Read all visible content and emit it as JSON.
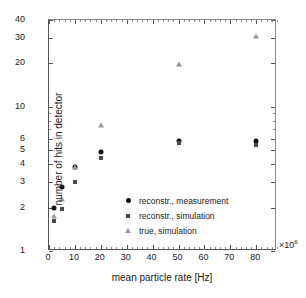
{
  "chart_data": {
    "type": "scatter",
    "title": "",
    "xlabel": "mean particle rate [Hz]",
    "ylabel": "number of hits in detector",
    "x_multiplier": "×10",
    "x_multiplier_exp": "6",
    "xlim": [
      0,
      88
    ],
    "ylim": [
      1,
      40
    ],
    "yscale": "log",
    "xscale": "linear",
    "grid": false,
    "legend_position": "center",
    "xticks": [
      0,
      10,
      20,
      30,
      40,
      50,
      60,
      70,
      80
    ],
    "xtick_labels": [
      "0",
      "10",
      "20",
      "30",
      "40",
      "50",
      "60",
      "70",
      "80"
    ],
    "yticks": [
      1,
      2,
      3,
      4,
      5,
      6,
      10,
      20,
      30,
      40
    ],
    "ytick_labels": [
      "1",
      "2",
      "3",
      "4",
      "5",
      "6",
      "10",
      "20",
      "30",
      "40"
    ],
    "yminor": [
      7,
      8,
      9
    ],
    "series": [
      {
        "name": "reconstr., measurement",
        "marker": "circle",
        "color": "#111111",
        "points": [
          {
            "x": 2,
            "y": 2.0
          },
          {
            "x": 5,
            "y": 2.78
          },
          {
            "x": 10,
            "y": 3.8
          },
          {
            "x": 20,
            "y": 4.85
          },
          {
            "x": 50,
            "y": 5.75
          },
          {
            "x": 80,
            "y": 5.8
          }
        ]
      },
      {
        "name": "reconstr., simulation",
        "marker": "square",
        "color": "#4a4a4a",
        "points": [
          {
            "x": 2,
            "y": 1.62
          },
          {
            "x": 5,
            "y": 1.95
          },
          {
            "x": 10,
            "y": 3.0
          },
          {
            "x": 20,
            "y": 4.4
          },
          {
            "x": 50,
            "y": 5.6
          },
          {
            "x": 80,
            "y": 5.45
          }
        ]
      },
      {
        "name": "true, simulation",
        "marker": "triangle",
        "color": "#9a9a9a",
        "points": [
          {
            "x": 2,
            "y": 1.75
          },
          {
            "x": 5,
            "y": 2.28
          },
          {
            "x": 10,
            "y": 3.85
          },
          {
            "x": 20,
            "y": 7.5
          },
          {
            "x": 50,
            "y": 19.7
          },
          {
            "x": 80,
            "y": 30.8
          }
        ]
      }
    ],
    "legend": [
      {
        "label": "reconstr., measurement",
        "marker": "circle"
      },
      {
        "label": "reconstr., simulation",
        "marker": "square"
      },
      {
        "label": "true, simulation",
        "marker": "triangle"
      }
    ]
  }
}
